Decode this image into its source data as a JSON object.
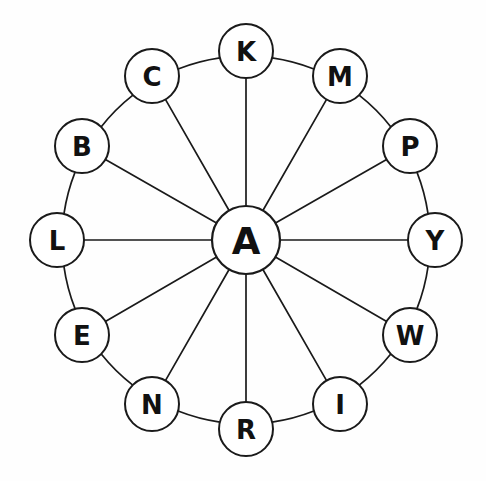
{
  "diagram": {
    "type": "hub-and-spoke-wheel",
    "title": "",
    "background_color": "#fefefe",
    "stroke_color": "#1a1a1a",
    "node_fill_color": "#ffffff",
    "label_color": "#111111",
    "canvas": {
      "width": 486,
      "height": 481
    },
    "center_node": {
      "label": "A",
      "cx": 246,
      "cy": 240,
      "r": 34
    },
    "ring": {
      "radius": 189,
      "node_radius": 27,
      "count": 12
    },
    "outer_nodes": [
      {
        "label": "K",
        "angle_deg": 90,
        "cx": 246,
        "cy": 51
      },
      {
        "label": "M",
        "angle_deg": 60,
        "cx": 340,
        "cy": 76
      },
      {
        "label": "P",
        "angle_deg": 30,
        "cx": 410,
        "cy": 146
      },
      {
        "label": "Y",
        "angle_deg": 0,
        "cx": 435,
        "cy": 240
      },
      {
        "label": "W",
        "angle_deg": -30,
        "cx": 410,
        "cy": 335
      },
      {
        "label": "I",
        "angle_deg": -60,
        "cx": 340,
        "cy": 404
      },
      {
        "label": "R",
        "angle_deg": -90,
        "cx": 246,
        "cy": 429
      },
      {
        "label": "N",
        "angle_deg": -120,
        "cx": 152,
        "cy": 404
      },
      {
        "label": "E",
        "angle_deg": -150,
        "cx": 82,
        "cy": 335
      },
      {
        "label": "L",
        "angle_deg": 180,
        "cx": 57,
        "cy": 240
      },
      {
        "label": "B",
        "angle_deg": 150,
        "cx": 82,
        "cy": 146
      },
      {
        "label": "C",
        "angle_deg": 120,
        "cx": 152,
        "cy": 76
      }
    ],
    "spokes": [
      {
        "from": "A",
        "to": "K"
      },
      {
        "from": "A",
        "to": "M"
      },
      {
        "from": "A",
        "to": "P"
      },
      {
        "from": "A",
        "to": "Y"
      },
      {
        "from": "A",
        "to": "W"
      },
      {
        "from": "A",
        "to": "I"
      },
      {
        "from": "A",
        "to": "R"
      },
      {
        "from": "A",
        "to": "N"
      },
      {
        "from": "A",
        "to": "E"
      },
      {
        "from": "A",
        "to": "L"
      },
      {
        "from": "A",
        "to": "B"
      },
      {
        "from": "A",
        "to": "C"
      }
    ],
    "rim_edges": [
      {
        "from": "K",
        "to": "M"
      },
      {
        "from": "M",
        "to": "P"
      },
      {
        "from": "P",
        "to": "Y"
      },
      {
        "from": "Y",
        "to": "W"
      },
      {
        "from": "W",
        "to": "I"
      },
      {
        "from": "I",
        "to": "R"
      },
      {
        "from": "R",
        "to": "N"
      },
      {
        "from": "N",
        "to": "E"
      },
      {
        "from": "E",
        "to": "L"
      },
      {
        "from": "L",
        "to": "B"
      },
      {
        "from": "B",
        "to": "C"
      },
      {
        "from": "C",
        "to": "K"
      }
    ]
  }
}
